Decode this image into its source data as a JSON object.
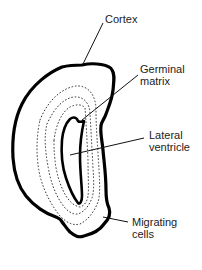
{
  "diagram": {
    "type": "anatomical cross-section (developing brain hemisphere)",
    "colors": {
      "outline": "#000000",
      "text": "#222222",
      "background": "#ffffff"
    },
    "labels": {
      "cortex": "Cortex",
      "germinal_matrix": "Germinal\nmatrix",
      "lateral_ventricle": "Lateral\nventricle",
      "migrating_cells": "Migrating\ncells"
    }
  }
}
